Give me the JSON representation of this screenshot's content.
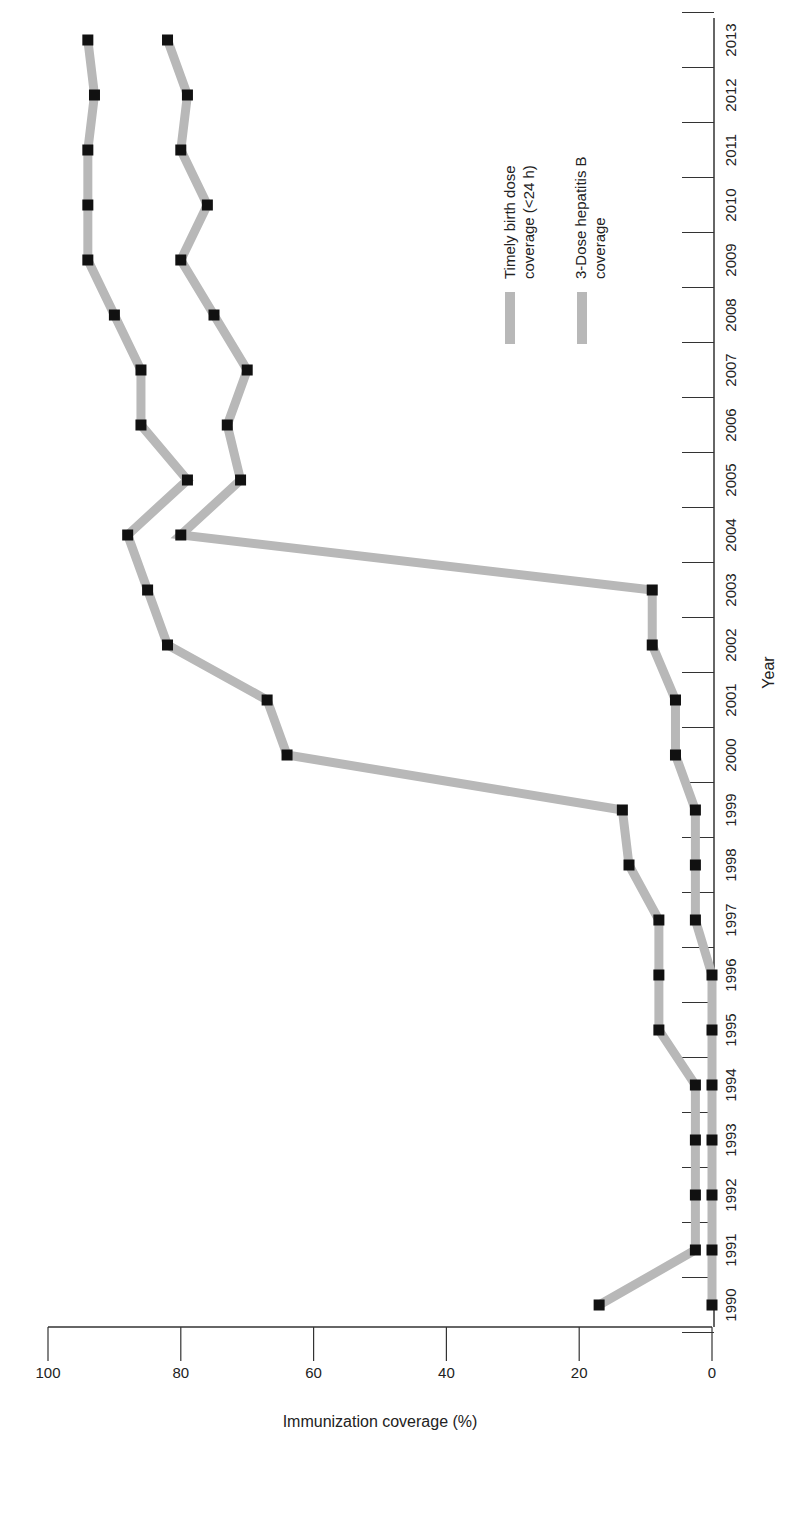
{
  "chart_data": {
    "type": "line",
    "title": "",
    "xlabel": "Year",
    "ylabel": "Immunization coverage (%)",
    "ylim": [
      0,
      100
    ],
    "yticks": [
      0,
      20,
      40,
      60,
      80,
      100
    ],
    "orientation": "rotated 90° clockwise (page rotated)",
    "grid": false,
    "legend_position": "upper right (inside plot)",
    "x": [
      1990,
      1991,
      1992,
      1993,
      1994,
      1995,
      1996,
      1997,
      1998,
      1999,
      2000,
      2001,
      2002,
      2003,
      2004,
      2005,
      2006,
      2007,
      2008,
      2009,
      2010,
      2011,
      2012,
      2013
    ],
    "series": [
      {
        "name": "Timely birth dose coverage (<24 h)",
        "color": "#b8b8b8",
        "marker_color": "#111111",
        "values": [
          0,
          0,
          0,
          0,
          0,
          0,
          0,
          2.5,
          2.5,
          2.5,
          5.5,
          5.5,
          9,
          9,
          80,
          71,
          73,
          70,
          75,
          80,
          76,
          80,
          79,
          82
        ]
      },
      {
        "name": "3-Dose hepatitis B coverage",
        "color": "#b8b8b8",
        "marker_color": "#111111",
        "values": [
          17,
          2.5,
          2.5,
          2.5,
          2.5,
          8,
          8,
          8,
          12.5,
          13.5,
          64,
          67,
          82,
          85,
          88,
          79,
          86,
          86,
          90,
          94,
          94,
          94,
          93,
          94
        ]
      }
    ]
  },
  "legend": {
    "items": [
      {
        "label_line1": "Timely birth dose",
        "label_line2": "coverage (<24 h)"
      },
      {
        "label_line1": "3-Dose hepatitis B",
        "label_line2": "coverage"
      }
    ]
  },
  "axes": {
    "xlabel": "Year",
    "ylabel": "Immunization coverage (%)",
    "ytick_labels": [
      "0",
      "20",
      "40",
      "60",
      "80",
      "100"
    ],
    "xtick_labels": [
      "1990",
      "1991",
      "1992",
      "1993",
      "1994",
      "1995",
      "1996",
      "1997",
      "1998",
      "1999",
      "2000",
      "2001",
      "2002",
      "2003",
      "2004",
      "2005",
      "2006",
      "2007",
      "2008",
      "2009",
      "2010",
      "2011",
      "2012",
      "2013"
    ]
  }
}
